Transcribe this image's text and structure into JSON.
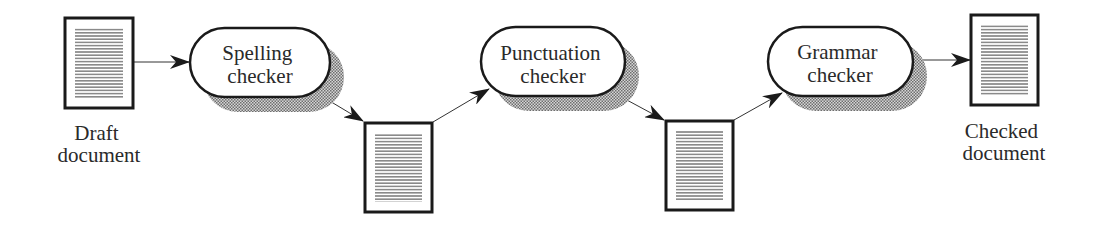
{
  "diagram": {
    "type": "pipeline",
    "colors": {
      "stroke": "#1a1a1a",
      "text": "#2a2a2a",
      "shadow": "#9a9a9a",
      "doc_lines": "#8a8a8a"
    },
    "documents": [
      {
        "id": "draft",
        "label_lines": [
          "Draft",
          "document"
        ]
      },
      {
        "id": "intermediate-1",
        "label_lines": []
      },
      {
        "id": "intermediate-2",
        "label_lines": []
      },
      {
        "id": "checked",
        "label_lines": [
          "Checked",
          "document"
        ]
      }
    ],
    "processes": [
      {
        "id": "spelling",
        "label_lines": [
          "Spelling",
          "checker"
        ]
      },
      {
        "id": "punctuation",
        "label_lines": [
          "Punctuation",
          "checker"
        ]
      },
      {
        "id": "grammar",
        "label_lines": [
          "Grammar",
          "checker"
        ]
      }
    ],
    "edges": [
      {
        "from": "draft",
        "to": "spelling"
      },
      {
        "from": "spelling",
        "to": "intermediate-1"
      },
      {
        "from": "intermediate-1",
        "to": "punctuation"
      },
      {
        "from": "punctuation",
        "to": "intermediate-2"
      },
      {
        "from": "intermediate-2",
        "to": "grammar"
      },
      {
        "from": "grammar",
        "to": "checked"
      }
    ]
  }
}
